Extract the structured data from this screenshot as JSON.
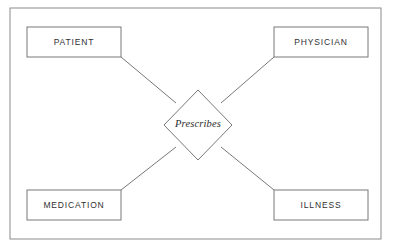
{
  "diagram": {
    "type": "entity-relationship-diagram",
    "frame": {
      "x": 10,
      "y": 8,
      "width": 371,
      "height": 231
    },
    "colors": {
      "background": "#ffffff",
      "stroke": "#77787a",
      "frame_stroke": "#8a8b8d",
      "entity_fill": "#ffffff",
      "text": "#303030"
    },
    "entities": [
      {
        "id": "patient",
        "label": "PATIENT",
        "x": 27,
        "y": 27,
        "width": 94,
        "height": 30,
        "label_x": 74,
        "label_y": 43
      },
      {
        "id": "physician",
        "label": "PHYSICIAN",
        "x": 274,
        "y": 27,
        "width": 94,
        "height": 30,
        "label_x": 321,
        "label_y": 43
      },
      {
        "id": "medication",
        "label": "MEDICATION",
        "x": 27,
        "y": 190,
        "width": 94,
        "height": 30,
        "label_x": 74,
        "label_y": 206
      },
      {
        "id": "illness",
        "label": "ILLNESS",
        "x": 274,
        "y": 190,
        "width": 94,
        "height": 30,
        "label_x": 321,
        "label_y": 206
      }
    ],
    "relationship": {
      "id": "prescribes",
      "label": "Prescribes",
      "center_x": 198,
      "center_y": 125,
      "half_width": 34,
      "half_height": 35,
      "points": "198,90 232,125 198,160 164,125"
    },
    "connectors": [
      {
        "id": "patient-prescribes",
        "from": "patient",
        "to": "prescribes",
        "x1": 121,
        "y1": 57,
        "x2": 176,
        "y2": 103
      },
      {
        "id": "physician-prescribes",
        "from": "physician",
        "to": "prescribes",
        "x1": 274,
        "y1": 57,
        "x2": 221,
        "y2": 103
      },
      {
        "id": "medication-prescribes",
        "from": "medication",
        "to": "prescribes",
        "x1": 121,
        "y1": 190,
        "x2": 176,
        "y2": 147
      },
      {
        "id": "illness-prescribes",
        "from": "illness",
        "to": "prescribes",
        "x1": 274,
        "y1": 190,
        "x2": 221,
        "y2": 147
      }
    ]
  }
}
